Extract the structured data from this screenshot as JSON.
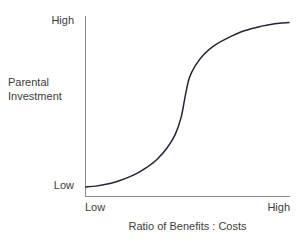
{
  "chart_data": {
    "type": "line",
    "title": "",
    "subtitle": "",
    "xlabel": "Ratio of Benefits : Costs",
    "ylabel": "Parental Investment",
    "ylabel_lines": [
      "Parental",
      "Investment"
    ],
    "x_tick_labels": [
      "Low",
      "High"
    ],
    "y_tick_labels": [
      "Low",
      "High"
    ],
    "grid": false,
    "legend": null,
    "xlim": [
      0,
      1
    ],
    "ylim": [
      0,
      1
    ],
    "axis_style": "left-and-bottom-spines-only",
    "line_color": "#262338",
    "axis_color": "#8d8d8d",
    "background_color": "#ffffff",
    "series": [
      {
        "name": "Parental investment response",
        "shape": "sigmoid",
        "description": "Steep logistic / S-shaped curve: flat at Low, sharp inflection near the middle of the x range, plateau at High",
        "inflection_x": 0.49,
        "points": [
          {
            "x": 0.0,
            "y": 0.045
          },
          {
            "x": 0.05,
            "y": 0.05
          },
          {
            "x": 0.1,
            "y": 0.06
          },
          {
            "x": 0.15,
            "y": 0.075
          },
          {
            "x": 0.2,
            "y": 0.095
          },
          {
            "x": 0.25,
            "y": 0.12
          },
          {
            "x": 0.3,
            "y": 0.155
          },
          {
            "x": 0.35,
            "y": 0.2
          },
          {
            "x": 0.4,
            "y": 0.265
          },
          {
            "x": 0.44,
            "y": 0.34
          },
          {
            "x": 0.47,
            "y": 0.44
          },
          {
            "x": 0.49,
            "y": 0.56
          },
          {
            "x": 0.51,
            "y": 0.66
          },
          {
            "x": 0.54,
            "y": 0.73
          },
          {
            "x": 0.58,
            "y": 0.79
          },
          {
            "x": 0.63,
            "y": 0.84
          },
          {
            "x": 0.7,
            "y": 0.885
          },
          {
            "x": 0.78,
            "y": 0.925
          },
          {
            "x": 0.86,
            "y": 0.95
          },
          {
            "x": 0.93,
            "y": 0.965
          },
          {
            "x": 1.0,
            "y": 0.972
          }
        ]
      }
    ]
  },
  "axes": {
    "y": {
      "title_line_1": "Parental",
      "title_line_2": "Investment",
      "tick_top": "High",
      "tick_bottom": "Low"
    },
    "x": {
      "title": "Ratio of Benefits : Costs",
      "tick_left": "Low",
      "tick_right": "High"
    }
  }
}
